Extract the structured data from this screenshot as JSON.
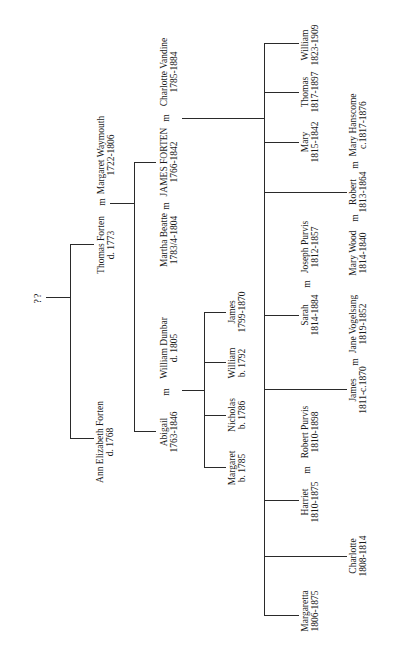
{
  "diagram": {
    "type": "family-tree",
    "orientation": "rotated-90-ccw",
    "line_color": "#2a2a2a",
    "root": {
      "label": "??"
    },
    "generation1": [
      {
        "id": "ann",
        "name": "Ann Elizabeth Forten",
        "dates": "d. 1768"
      },
      {
        "id": "thomas_sr",
        "name": "Thomas Forten",
        "dates": "d. 1773",
        "spouse": {
          "name": "Margaret Waymouth",
          "dates": "1722-1806"
        }
      }
    ],
    "generation2": [
      {
        "id": "abigail",
        "name": "Abigail",
        "dates": "1763-1846",
        "spouse": {
          "name": "William Dunbar",
          "dates": "d. 1805"
        }
      },
      {
        "id": "james_forten",
        "name": "JAMES FORTEN",
        "dates": "1766-1842",
        "spouse1": {
          "name": "Martha Beatte",
          "dates": "1783/4-1804"
        },
        "spouse2": {
          "name": "Charlotte Vandine",
          "dates": "1785-1884"
        }
      }
    ],
    "dunbar_children": [
      {
        "name": "Margaret",
        "dates": "b. 1785"
      },
      {
        "name": "Nicholas",
        "dates": "b. 1786"
      },
      {
        "name": "William",
        "dates": "b. 1792"
      },
      {
        "name": "James",
        "dates": "1799-1870"
      }
    ],
    "forten_children": [
      {
        "name": "Margaretta",
        "dates": "1806-1875"
      },
      {
        "name": "Charlotte",
        "dates": "1808-1814"
      },
      {
        "name": "Harriet",
        "dates": "1810-1875",
        "spouse": {
          "name": "Robert Purvis",
          "dates": "1810-1898"
        }
      },
      {
        "name": "James",
        "dates": "1811-c.1870",
        "spouse": {
          "name": "Jane Vogelsang",
          "dates": "1819-1852"
        }
      },
      {
        "name": "Sarah",
        "dates": "1814-1884",
        "spouse": {
          "name": "Joseph Purvis",
          "dates": "1812-1857"
        }
      },
      {
        "name": "Robert",
        "dates": "1813-1864",
        "spouse1": {
          "name": "Mary Wood",
          "dates": "1814-1840"
        },
        "spouse2": {
          "name": "Mary Hanscome",
          "dates": "c.1817-1876"
        }
      },
      {
        "name": "Mary",
        "dates": "1815-1842"
      },
      {
        "name": "Thomas",
        "dates": "1817-1897"
      },
      {
        "name": "William",
        "dates": "1823-1909"
      }
    ],
    "marriage_symbol": "m"
  }
}
